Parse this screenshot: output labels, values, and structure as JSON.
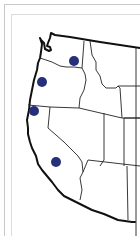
{
  "map": {
    "region": "Western United States",
    "states_visible": [
      "Washington",
      "Oregon",
      "California",
      "Idaho",
      "Nevada",
      "Montana",
      "Utah",
      "Arizona",
      "Wyoming"
    ],
    "marker_color": "#262f7a",
    "markers": [
      {
        "name": "marker-washington",
        "state": "Washington",
        "cx": 74,
        "cy": 61,
        "r": 5
      },
      {
        "name": "marker-oregon",
        "state": "Oregon",
        "cx": 42,
        "cy": 82,
        "r": 5
      },
      {
        "name": "marker-northern-california",
        "state": "California",
        "cx": 34,
        "cy": 111,
        "r": 5
      },
      {
        "name": "marker-central-california",
        "state": "California",
        "cx": 56,
        "cy": 162,
        "r": 5
      }
    ]
  }
}
